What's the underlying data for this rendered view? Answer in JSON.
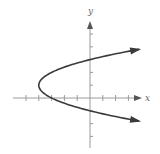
{
  "chart_data": {
    "type": "line",
    "title": "",
    "xlabel": "x",
    "ylabel": "y",
    "equation": "x = (y - 1)^2 - 4",
    "xlim": [
      -6,
      4
    ],
    "ylim": [
      -4,
      6
    ],
    "grid": false,
    "legend": null,
    "x_ticks": [
      -5,
      -4,
      -3,
      -2,
      -1,
      1,
      2,
      3
    ],
    "y_ticks": [
      -3,
      -2,
      -1,
      1,
      2,
      3,
      4,
      5
    ],
    "tick_labels_shown": false,
    "vertex": {
      "x": -4,
      "y": 1
    },
    "intercepts": {
      "x_intercept": {
        "x": -3,
        "y": 0
      },
      "y_intercepts": [
        {
          "x": 0,
          "y": 3
        },
        {
          "x": 0,
          "y": -1
        }
      ]
    },
    "series": [
      {
        "name": "parabola",
        "x": [
          3.8,
          2.25,
          0,
          -1.75,
          -3,
          -3.75,
          -4,
          -3.75,
          -3,
          -1.75,
          0,
          2.25,
          3.8
        ],
        "y": [
          3.8,
          3.5,
          3,
          2.5,
          2,
          1.5,
          1,
          0.5,
          0,
          -0.5,
          -1,
          -1.5,
          -1.8
        ],
        "arrows_at_ends": true
      }
    ]
  },
  "labels": {
    "x_axis": "x",
    "y_axis": "y"
  }
}
